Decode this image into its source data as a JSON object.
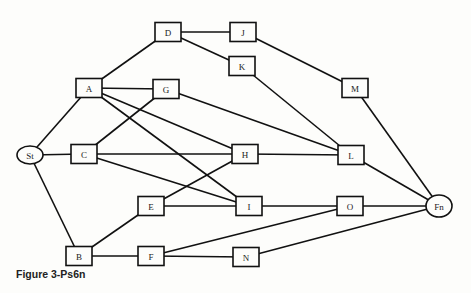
{
  "caption": "Figure 3-Ps6n",
  "colors": {
    "line": "#111111",
    "background": "#fdfdfb"
  },
  "nodes": [
    {
      "id": "St",
      "label": "St",
      "shape": "ellipse",
      "x": 30,
      "y": 155,
      "w": 26,
      "h": 18
    },
    {
      "id": "A",
      "label": "A",
      "shape": "box",
      "x": 89,
      "y": 88,
      "w": 26,
      "h": 19
    },
    {
      "id": "D",
      "label": "D",
      "shape": "box",
      "x": 168,
      "y": 32,
      "w": 26,
      "h": 19
    },
    {
      "id": "J",
      "label": "J",
      "shape": "box",
      "x": 243,
      "y": 32,
      "w": 26,
      "h": 19
    },
    {
      "id": "K",
      "label": "K",
      "shape": "box",
      "x": 242,
      "y": 66,
      "w": 26,
      "h": 19
    },
    {
      "id": "M",
      "label": "M",
      "shape": "box",
      "x": 355,
      "y": 88,
      "w": 26,
      "h": 19
    },
    {
      "id": "G",
      "label": "G",
      "shape": "box",
      "x": 166,
      "y": 89,
      "w": 26,
      "h": 19
    },
    {
      "id": "C",
      "label": "C",
      "shape": "box",
      "x": 84,
      "y": 154,
      "w": 26,
      "h": 19
    },
    {
      "id": "H",
      "label": "H",
      "shape": "box",
      "x": 245,
      "y": 154,
      "w": 26,
      "h": 19
    },
    {
      "id": "L",
      "label": "L",
      "shape": "box",
      "x": 351,
      "y": 155,
      "w": 26,
      "h": 19
    },
    {
      "id": "E",
      "label": "E",
      "shape": "box",
      "x": 151,
      "y": 206,
      "w": 26,
      "h": 19
    },
    {
      "id": "I",
      "label": "I",
      "shape": "box",
      "x": 249,
      "y": 206,
      "w": 26,
      "h": 19
    },
    {
      "id": "O",
      "label": "O",
      "shape": "box",
      "x": 350,
      "y": 206,
      "w": 26,
      "h": 19
    },
    {
      "id": "Fn",
      "label": "Fn",
      "shape": "ellipse",
      "x": 439,
      "y": 206,
      "w": 26,
      "h": 22
    },
    {
      "id": "B",
      "label": "B",
      "shape": "box",
      "x": 79,
      "y": 256,
      "w": 26,
      "h": 19
    },
    {
      "id": "F",
      "label": "F",
      "shape": "box",
      "x": 151,
      "y": 256,
      "w": 26,
      "h": 19
    },
    {
      "id": "N",
      "label": "N",
      "shape": "box",
      "x": 246,
      "y": 257,
      "w": 26,
      "h": 19
    }
  ],
  "edges": [
    [
      "St",
      "A"
    ],
    [
      "St",
      "C"
    ],
    [
      "St",
      "B"
    ],
    [
      "A",
      "D"
    ],
    [
      "A",
      "G"
    ],
    [
      "A",
      "H"
    ],
    [
      "A",
      "I"
    ],
    [
      "D",
      "J"
    ],
    [
      "D",
      "K"
    ],
    [
      "J",
      "M"
    ],
    [
      "K",
      "L"
    ],
    [
      "G",
      "C"
    ],
    [
      "G",
      "L"
    ],
    [
      "C",
      "H"
    ],
    [
      "C",
      "I"
    ],
    [
      "H",
      "L"
    ],
    [
      "H",
      "E"
    ],
    [
      "E",
      "I"
    ],
    [
      "E",
      "B"
    ],
    [
      "B",
      "F"
    ],
    [
      "F",
      "N"
    ],
    [
      "F",
      "O"
    ],
    [
      "I",
      "O"
    ],
    [
      "O",
      "Fn"
    ],
    [
      "L",
      "Fn"
    ],
    [
      "M",
      "Fn"
    ],
    [
      "N",
      "Fn"
    ]
  ]
}
